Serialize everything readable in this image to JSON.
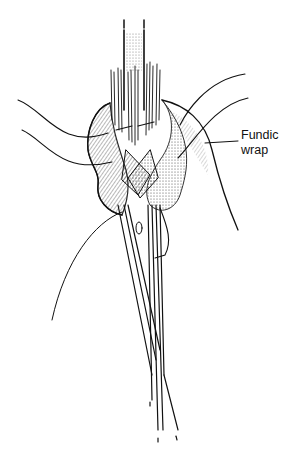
{
  "figure": {
    "label": {
      "line1": "Fundic",
      "line2": "wrap"
    },
    "colors": {
      "ink": "#111111",
      "background": "#ffffff"
    }
  }
}
